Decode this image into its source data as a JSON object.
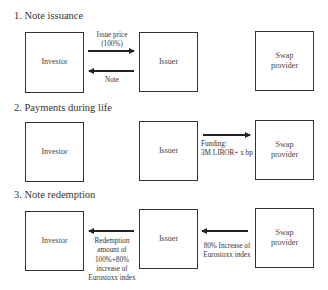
{
  "sections": [
    {
      "heading": "1. Note issuance",
      "boxes": {
        "investor": "Investor",
        "issuer": "Issuer",
        "swap": "Swap provider"
      },
      "arrows": [
        {
          "from": "investor",
          "to": "issuer",
          "label_line1": "Issue price",
          "label_line2": "(100%)"
        },
        {
          "from": "issuer",
          "to": "investor",
          "label": "Note"
        }
      ]
    },
    {
      "heading": "2. Payments during life",
      "boxes": {
        "investor": "Investor",
        "issuer": "Issuer",
        "swap": "Swap provider"
      },
      "arrows": [
        {
          "from": "issuer",
          "to": "swap",
          "label_line1": "Funding:",
          "label_line2": "3M LIBOR+ x bp"
        }
      ]
    },
    {
      "heading": "3. Note redemption",
      "boxes": {
        "investor": "Investor",
        "issuer": "Issuer",
        "swap": "Swap provider"
      },
      "arrows": [
        {
          "from": "issuer",
          "to": "investor",
          "label_lines": [
            "Redemption",
            "amount of",
            "100%+80%",
            "increase of",
            "Eurostoxx index"
          ]
        },
        {
          "from": "swap",
          "to": "issuer",
          "label_line1": "80% Increase of",
          "label_line2": "Eurostoxx index"
        }
      ]
    }
  ],
  "swap_line1": "Swap",
  "swap_line2": "provider"
}
